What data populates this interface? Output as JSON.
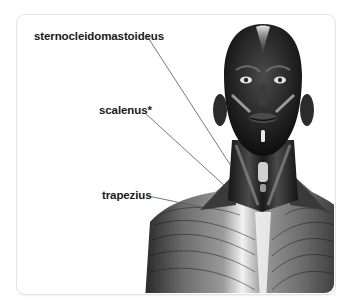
{
  "figure": {
    "labels": [
      {
        "id": "sternocleidomastoideus",
        "text": "sternocleidomastoideus"
      },
      {
        "id": "scalenus",
        "text": "scalenus*"
      },
      {
        "id": "trapezius",
        "text": "trapezius"
      }
    ]
  },
  "colors": {
    "card_border": "#e4e4e4",
    "label_text": "#1a1a1a",
    "leader_line": "#555555",
    "muscle_dark": "#1c1c1c",
    "muscle_mid": "#5a5a5a",
    "muscle_light": "#d8d8d8"
  }
}
